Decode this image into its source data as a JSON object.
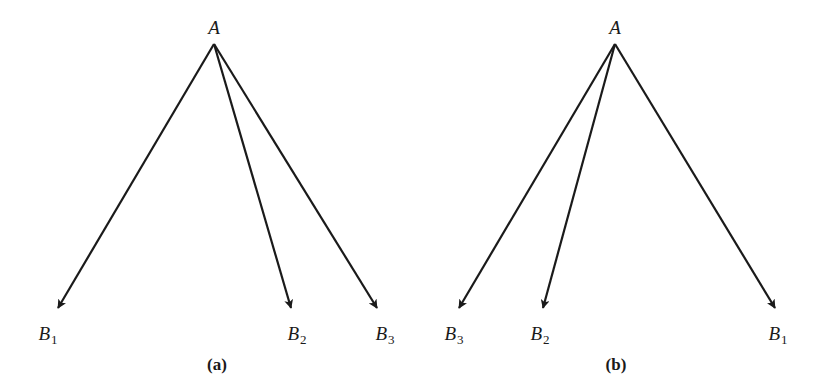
{
  "diagrams": [
    {
      "caption": "(a)",
      "caption_pos": [
        217,
        364
      ],
      "source": {
        "label": "A",
        "label_pos": [
          214,
          27
        ],
        "apex": [
          214,
          44
        ]
      },
      "targets": [
        {
          "name": "B",
          "sub": "1",
          "tip": [
            58,
            308
          ],
          "label_pos": [
            48,
            335
          ]
        },
        {
          "name": "B",
          "sub": "2",
          "tip": [
            291,
            308
          ],
          "label_pos": [
            297,
            335
          ]
        },
        {
          "name": "B",
          "sub": "3",
          "tip": [
            377,
            308
          ],
          "label_pos": [
            385,
            335
          ]
        }
      ]
    },
    {
      "caption": "(b)",
      "caption_pos": [
        616,
        364
      ],
      "source": {
        "label": "A",
        "label_pos": [
          615,
          27
        ],
        "apex": [
          615,
          44
        ]
      },
      "targets": [
        {
          "name": "B",
          "sub": "3",
          "tip": [
            459,
            308
          ],
          "label_pos": [
            454,
            335
          ]
        },
        {
          "name": "B",
          "sub": "2",
          "tip": [
            543,
            308
          ],
          "label_pos": [
            540,
            335
          ]
        },
        {
          "name": "B",
          "sub": "1",
          "tip": [
            775,
            308
          ],
          "label_pos": [
            778,
            335
          ]
        }
      ]
    }
  ],
  "style": {
    "stroke": "#1a1a1a",
    "stroke_width": 2.2
  }
}
